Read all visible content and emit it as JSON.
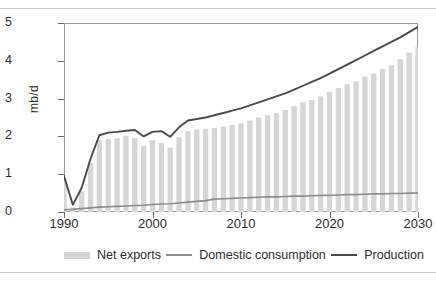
{
  "figure": {
    "y_axis_label": "mb/d",
    "title_partial": ""
  },
  "legend": {
    "items": [
      {
        "label": "Net exports",
        "marker": "bar-swatch",
        "color": "#d6d6d6"
      },
      {
        "label": "Domestic consumption",
        "marker": "line-swatch",
        "color": "#8d8d8d"
      },
      {
        "label": "Production",
        "marker": "line-swatch",
        "color": "#4a4a4a"
      }
    ]
  },
  "chart_data": {
    "type": "bar",
    "title": "",
    "subtitle": "",
    "xlabel": "",
    "ylabel": "mb/d",
    "xlim": [
      1990,
      2030
    ],
    "ylim": [
      0,
      5
    ],
    "ytick_labels": [
      "0",
      "1",
      "2",
      "3",
      "4",
      "5"
    ],
    "ytick_values": [
      0,
      1,
      2,
      3,
      4,
      5
    ],
    "xtick_labels": [
      "1990",
      "2000",
      "2010",
      "2020",
      "2030"
    ],
    "xtick_values": [
      1990,
      2000,
      2010,
      2020,
      2030
    ],
    "grid": false,
    "legend_position": "bottom",
    "x": [
      1990,
      1991,
      1992,
      1993,
      1994,
      1995,
      1996,
      1997,
      1998,
      1999,
      2000,
      2001,
      2002,
      2003,
      2004,
      2005,
      2006,
      2007,
      2008,
      2009,
      2010,
      2011,
      2012,
      2013,
      2014,
      2015,
      2016,
      2017,
      2018,
      2019,
      2020,
      2021,
      2022,
      2023,
      2024,
      2025,
      2026,
      2027,
      2028,
      2029,
      2030
    ],
    "series": [
      {
        "name": "Net exports",
        "type": "bar",
        "color": "#d6d6d6",
        "values": [
          0.9,
          0.12,
          0.55,
          1.3,
          1.9,
          1.93,
          1.95,
          2.02,
          1.95,
          1.75,
          1.9,
          1.83,
          1.7,
          1.98,
          2.14,
          2.18,
          2.2,
          2.22,
          2.26,
          2.3,
          2.34,
          2.42,
          2.5,
          2.56,
          2.62,
          2.7,
          2.8,
          2.9,
          2.96,
          3.06,
          3.18,
          3.28,
          3.38,
          3.46,
          3.58,
          3.66,
          3.78,
          3.88,
          4.04,
          4.22,
          4.36
        ]
      },
      {
        "name": "Domestic consumption",
        "type": "line",
        "color": "#8d8d8d",
        "values": [
          0.06,
          0.07,
          0.09,
          0.11,
          0.13,
          0.14,
          0.15,
          0.16,
          0.17,
          0.18,
          0.2,
          0.21,
          0.22,
          0.24,
          0.26,
          0.28,
          0.3,
          0.34,
          0.35,
          0.36,
          0.37,
          0.38,
          0.39,
          0.4,
          0.4,
          0.41,
          0.42,
          0.42,
          0.43,
          0.44,
          0.44,
          0.45,
          0.46,
          0.46,
          0.47,
          0.48,
          0.48,
          0.49,
          0.49,
          0.5,
          0.5
        ]
      },
      {
        "name": "Production",
        "type": "line",
        "color": "#4a4a4a",
        "values": [
          0.95,
          0.19,
          0.64,
          1.41,
          2.03,
          2.1,
          2.12,
          2.15,
          2.17,
          2.0,
          2.12,
          2.14,
          1.99,
          2.24,
          2.42,
          2.46,
          2.5,
          2.56,
          2.62,
          2.68,
          2.74,
          2.82,
          2.9,
          2.98,
          3.06,
          3.14,
          3.24,
          3.34,
          3.44,
          3.54,
          3.66,
          3.78,
          3.9,
          4.02,
          4.14,
          4.26,
          4.38,
          4.5,
          4.62,
          4.76,
          4.9
        ]
      }
    ]
  }
}
